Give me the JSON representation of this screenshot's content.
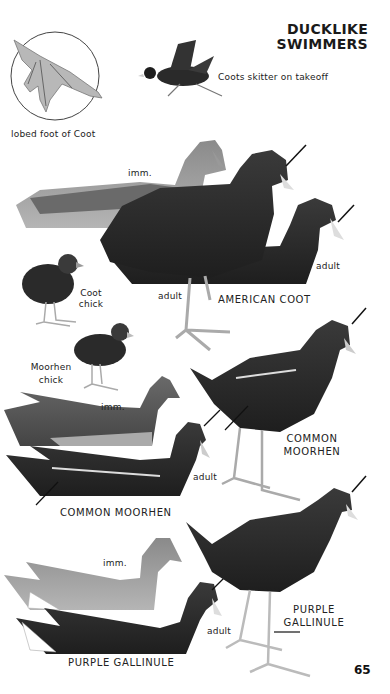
{
  "page": {
    "title_line1": "DUCKLIKE",
    "title_line2": "SWIMMERS",
    "page_number": "65"
  },
  "captions": {
    "foot": "lobed foot of Coot",
    "takeoff": "Coots skitter on takeoff",
    "coot_imm": "imm.",
    "coot_adult_swim": "adult",
    "coot_adult_stand": "adult",
    "american_coot": "AMERICAN COOT",
    "coot_chick_1": "Coot",
    "coot_chick_2": "chick",
    "moorhen_chick_1": "Moorhen",
    "moorhen_chick_2": "chick",
    "moorhen_imm": "imm.",
    "moorhen_adult": "adult",
    "common_moorhen_stand_1": "COMMON",
    "common_moorhen_stand_2": "MOORHEN",
    "common_moorhen_swim": "COMMON MOORHEN",
    "gallinule_imm": "imm.",
    "gallinule_adult": "adult",
    "purple_gallinule_stand_1": "PURPLE",
    "purple_gallinule_stand_2": "GALLINULE",
    "purple_gallinule_swim": "PURPLE GALLINULE"
  },
  "colors": {
    "background": "#ffffff",
    "bird_dark": "#2a2a2a",
    "bird_mid": "#5a5a5a",
    "bird_light": "#9a9a9a",
    "bill": "#d8d8d8"
  }
}
